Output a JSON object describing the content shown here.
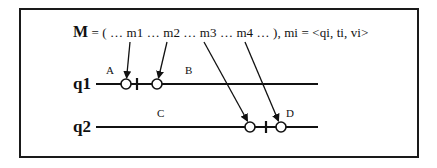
{
  "header": {
    "symbol": "M",
    "sequence": " = ( … m1 …  m2  … m3 …  m4 … ), mi = <qi, ti, vi>"
  },
  "processes": [
    {
      "label": "q1",
      "y": 84
    },
    {
      "label": "q2",
      "y": 127
    }
  ],
  "regions": [
    {
      "label": "A"
    },
    {
      "label": "B"
    },
    {
      "label": "C"
    },
    {
      "label": "D"
    }
  ],
  "messages": [
    {
      "name": "m1",
      "target": "q1"
    },
    {
      "name": "m2",
      "target": "q1"
    },
    {
      "name": "m3",
      "target": "q2"
    },
    {
      "name": "m4",
      "target": "q2"
    }
  ],
  "colors": {
    "ink": "#111111",
    "background": "#ffffff"
  }
}
